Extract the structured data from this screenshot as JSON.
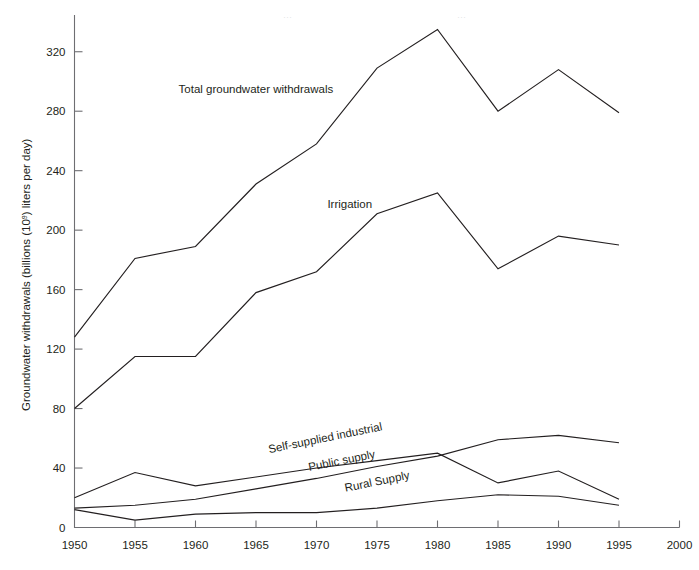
{
  "chart_data": {
    "type": "line",
    "title": "",
    "xlabel": "",
    "ylabel": "Groundwater withdrawals (billions (10⁹) liters per day)",
    "xlim": [
      1950,
      2000
    ],
    "ylim": [
      0,
      340
    ],
    "grid": false,
    "legend_position": "inline-annotations",
    "x": [
      1950,
      1955,
      1960,
      1965,
      1970,
      1975,
      1980,
      1985,
      1990,
      1995
    ],
    "xticks": [
      1950,
      1955,
      1960,
      1965,
      1970,
      1975,
      1980,
      1985,
      1990,
      1995,
      2000
    ],
    "xtick_labels": [
      "1950",
      "1955",
      "1960",
      "1965",
      "1970",
      "1975",
      "1980",
      "1985",
      "1990",
      "1995",
      "2000"
    ],
    "yticks": [
      0,
      40,
      80,
      120,
      160,
      200,
      240,
      280,
      320
    ],
    "ytick_labels": [
      "0",
      "40",
      "80",
      "120",
      "160",
      "200",
      "240",
      "280",
      "320"
    ],
    "series": [
      {
        "name": "Total groundwater withdrawals",
        "label": "Total groundwater withdrawals",
        "values": [
          128,
          181,
          189,
          231,
          258,
          309,
          335,
          280,
          308,
          279
        ]
      },
      {
        "name": "Irrigation",
        "label": "Irrigation",
        "values": [
          80,
          115,
          115,
          158,
          172,
          211,
          225,
          174,
          196,
          190
        ]
      },
      {
        "name": "Self-supplied industrial",
        "label": "Self-supplied industrial",
        "values": [
          20,
          37,
          28,
          34,
          40,
          45,
          50,
          30,
          38,
          19
        ]
      },
      {
        "name": "Public supply",
        "label": "Public supply",
        "values": [
          13,
          15,
          19,
          26,
          33,
          41,
          48,
          59,
          62,
          57
        ]
      },
      {
        "name": "Rural Supply",
        "label": "Rural Supply",
        "values": [
          12,
          5,
          9,
          10,
          10,
          13,
          18,
          22,
          21,
          15
        ]
      }
    ],
    "annotations": [
      {
        "text": "Total groundwater withdrawals",
        "x": 1958.6,
        "y": 292
      },
      {
        "text": "Irrigation",
        "x": 1970.9,
        "y": 215
      },
      {
        "text": "Self-supplied industrial",
        "x": 1966.1,
        "y": 50
      },
      {
        "text": "Public supply",
        "x": 1969.4,
        "y": 38
      },
      {
        "text": "Rural Supply",
        "x": 1972.4,
        "y": 24
      }
    ],
    "colors": {
      "line": "#231f20",
      "axis": "#6e6e72",
      "background": "#ffffff",
      "text": "#231f20"
    }
  }
}
